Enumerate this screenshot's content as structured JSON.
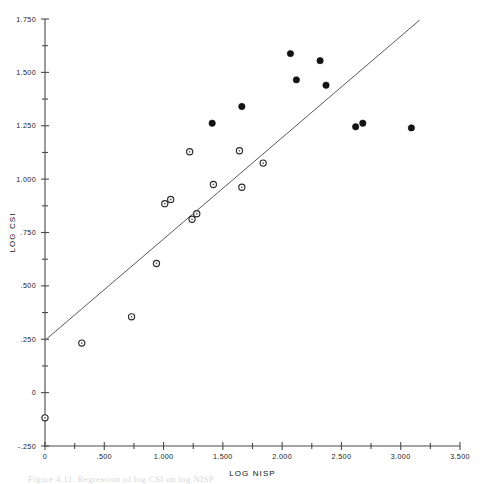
{
  "figure": {
    "caption": "Figure 4.11.  Regression of log CSI on log NISP"
  },
  "chart_data": {
    "type": "scatter",
    "title": "",
    "xlabel": "LOG NISP",
    "ylabel": "LOG CSI",
    "xlim": [
      0,
      3.5
    ],
    "ylim": [
      -0.25,
      1.75
    ],
    "grid": false,
    "legend": "none",
    "x_ticks": [
      0,
      0.5,
      1.0,
      1.5,
      2.0,
      2.5,
      3.0,
      3.5
    ],
    "x_ticklabels": [
      "0",
      ".500",
      "1.000",
      "1.500",
      "2.000",
      "2.500",
      "3.000",
      "3.500"
    ],
    "x_minor_ticks": [
      0.25,
      0.75,
      1.25,
      1.75,
      2.25,
      2.75,
      3.25
    ],
    "y_ticks": [
      -0.25,
      0,
      0.25,
      0.5,
      0.75,
      1.0,
      1.25,
      1.5,
      1.75
    ],
    "y_ticklabels": [
      "-.250",
      "0",
      ".250",
      ".500",
      ".750",
      "1.000",
      "1.250",
      "1.500",
      "1.750"
    ],
    "y_minor_ticks": [
      -0.125,
      0.125,
      0.375,
      0.625,
      0.875,
      1.125,
      1.375,
      1.625
    ],
    "marker_colors": {
      "open": "#ffffff",
      "open_edge": "#2b2b2b",
      "filled": "#131313"
    },
    "line_color": "#5a5a5a",
    "axis_color": "#4a4a4a",
    "fit_line": {
      "x": [
        0.0,
        3.16
      ],
      "y": [
        0.245,
        1.745
      ]
    },
    "series": [
      {
        "name": "open-circles",
        "marker": "open-circle",
        "points": [
          [
            0.0,
            -0.118
          ],
          [
            0.31,
            0.232
          ],
          [
            0.73,
            0.355
          ],
          [
            0.94,
            0.605
          ],
          [
            1.01,
            0.885
          ],
          [
            1.06,
            0.905
          ],
          [
            1.24,
            0.812
          ],
          [
            1.28,
            0.838
          ],
          [
            1.22,
            1.128
          ],
          [
            1.64,
            1.133
          ],
          [
            1.42,
            0.975
          ],
          [
            1.66,
            0.962
          ],
          [
            1.84,
            1.075
          ]
        ]
      },
      {
        "name": "filled-circles",
        "marker": "filled-circle",
        "points": [
          [
            1.41,
            1.262
          ],
          [
            1.66,
            1.34
          ],
          [
            2.07,
            1.588
          ],
          [
            2.12,
            1.465
          ],
          [
            2.32,
            1.555
          ],
          [
            2.37,
            1.44
          ],
          [
            2.62,
            1.245
          ],
          [
            2.68,
            1.262
          ],
          [
            3.09,
            1.24
          ]
        ]
      }
    ]
  }
}
